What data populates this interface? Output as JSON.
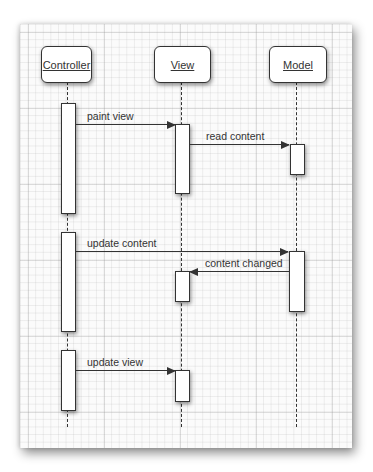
{
  "diagram": {
    "type": "sequence-diagram",
    "participants": [
      {
        "id": "controller",
        "label": "Controller"
      },
      {
        "id": "view",
        "label": "View"
      },
      {
        "id": "model",
        "label": "Model"
      }
    ],
    "messages": [
      {
        "from": "controller",
        "to": "view",
        "label": "paint view"
      },
      {
        "from": "view",
        "to": "model",
        "label": "read content"
      },
      {
        "from": "controller",
        "to": "model",
        "label": "update content"
      },
      {
        "from": "model",
        "to": "view",
        "label": "content changed"
      },
      {
        "from": "controller",
        "to": "view",
        "label": "update view"
      }
    ]
  }
}
